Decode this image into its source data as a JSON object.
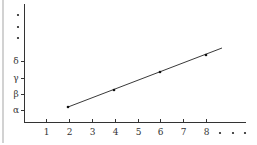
{
  "chart_data": {
    "type": "line",
    "title": "",
    "xlabel": "",
    "ylabel": "",
    "x_ticks": [
      "1",
      "2",
      "3",
      "4",
      "5",
      "6",
      "7",
      "8"
    ],
    "x_continuation": "...",
    "y_ticks": [
      "α",
      "β",
      "γ",
      "δ"
    ],
    "y_continuation": "⋮",
    "series": [
      {
        "name": "line",
        "x": [
          2,
          4,
          6,
          8
        ],
        "y": [
          "α+0.3",
          "β+0.6",
          "γ+0.9",
          "δ+1.2"
        ],
        "note": "Linear increasing line through marked points at x=2,4,6,8; extends slightly beyond x=8"
      }
    ],
    "grid": false,
    "legend": null
  },
  "axes": {
    "x_ticks": [
      {
        "label": "1",
        "px": 46
      },
      {
        "label": "2",
        "px": 69
      },
      {
        "label": "3",
        "px": 92
      },
      {
        "label": "4",
        "px": 115
      },
      {
        "label": "5",
        "px": 138
      },
      {
        "label": "6",
        "px": 160
      },
      {
        "label": "7",
        "px": 183
      },
      {
        "label": "8",
        "px": 206
      }
    ],
    "y_ticks": [
      {
        "label": "α",
        "py": 110
      },
      {
        "label": "β",
        "py": 94
      },
      {
        "label": "γ",
        "py": 78
      },
      {
        "label": "δ",
        "py": 61
      }
    ]
  },
  "points": [
    {
      "x": 68,
      "y": 107
    },
    {
      "x": 114,
      "y": 90
    },
    {
      "x": 160,
      "y": 72
    },
    {
      "x": 206,
      "y": 55
    }
  ],
  "line": {
    "x1": 68,
    "y1": 107,
    "x2": 222,
    "y2": 48
  }
}
